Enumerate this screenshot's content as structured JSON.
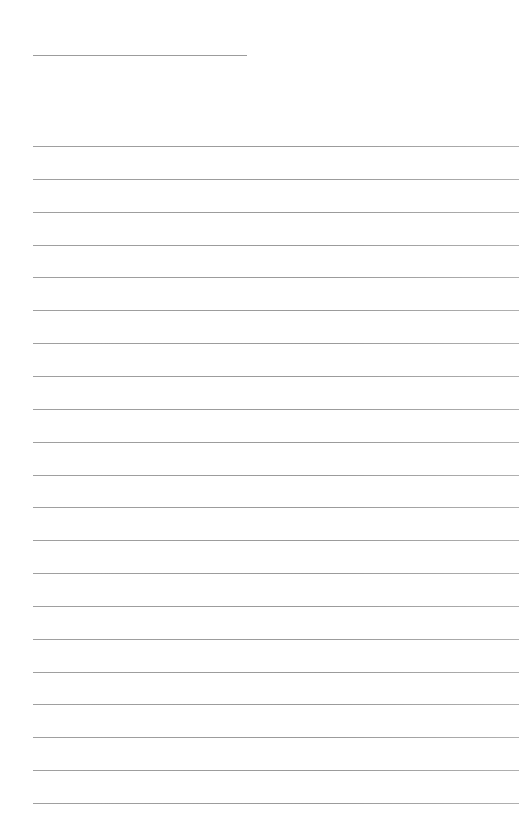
{
  "page": {
    "type": "lined-paper",
    "background_color": "#ffffff",
    "line_color": "#9c9c9c",
    "title_line": {
      "present": true,
      "text": ""
    },
    "ruled_lines": {
      "count": 21,
      "start_y": 146,
      "spacing": 32.85
    }
  }
}
